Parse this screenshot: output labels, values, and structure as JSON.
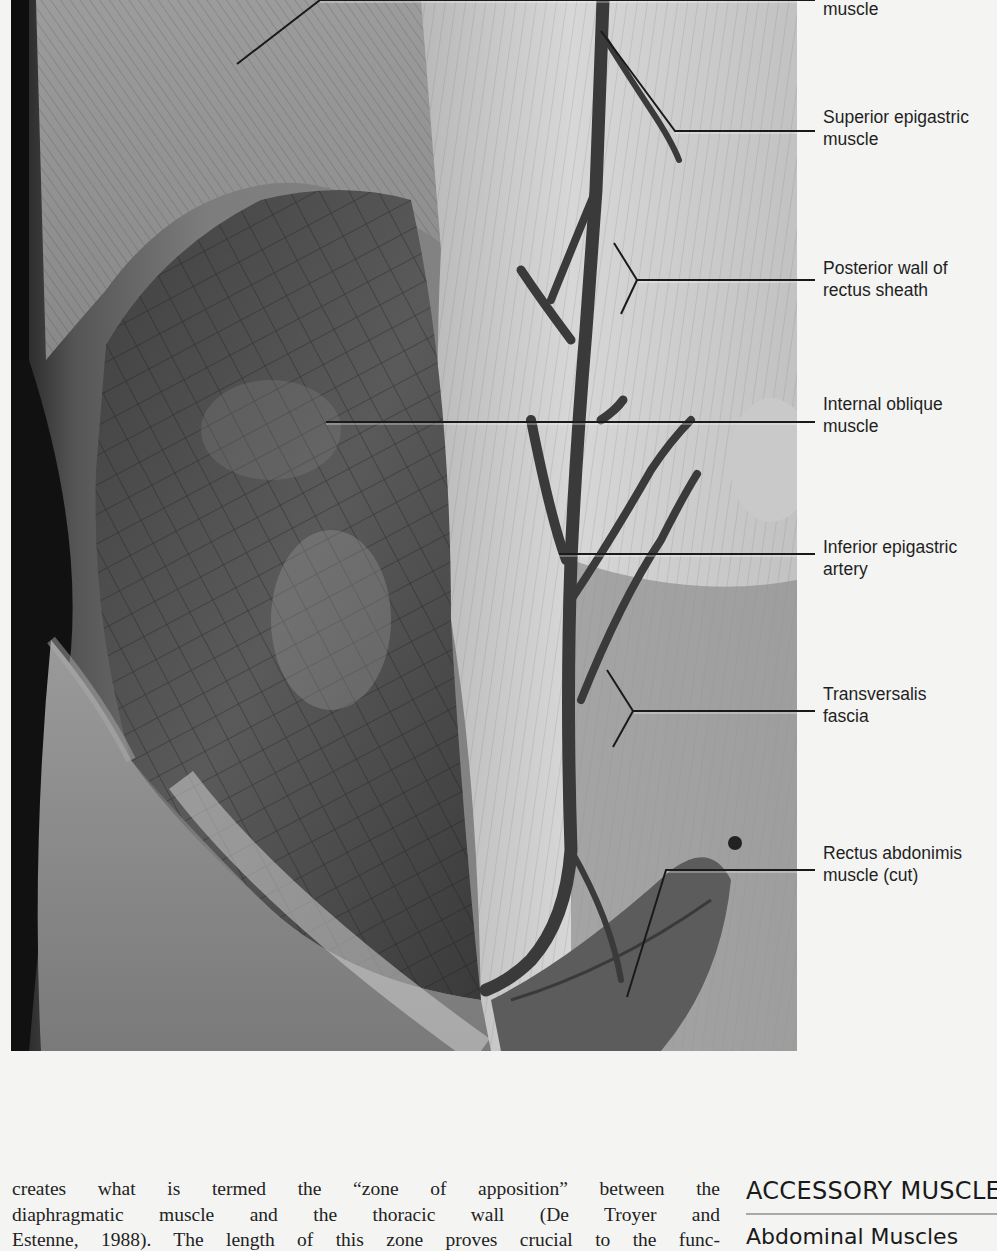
{
  "figure": {
    "colors": {
      "background": "#f4f4f2",
      "photo_dark": "#2a2a2a",
      "photo_mid": "#7a7a7a",
      "photo_light": "#d8d8d8",
      "leader_line": "#1a1a1a"
    },
    "labels": [
      {
        "id": "external-oblique",
        "lines": [
          "muscle"
        ]
      },
      {
        "id": "superior-epigastric",
        "lines": [
          "Superior epigastric",
          "muscle"
        ]
      },
      {
        "id": "posterior-wall",
        "lines": [
          "Posterior wall of",
          "rectus sheath"
        ]
      },
      {
        "id": "internal-oblique",
        "lines": [
          "Internal oblique",
          "muscle"
        ]
      },
      {
        "id": "inferior-epigastric",
        "lines": [
          "Inferior epigastric",
          "artery"
        ]
      },
      {
        "id": "transversalis",
        "lines": [
          "Transversalis",
          "fascia"
        ]
      },
      {
        "id": "rectus-abdominis",
        "lines": [
          "Rectus abdonimis",
          "muscle (cut)"
        ]
      }
    ]
  },
  "body": {
    "lines": [
      "creates what is termed the “zone of apposition” between the",
      "diaphragmatic muscle and the thoracic wall (De Troyer and",
      "Estenne, 1988). The length of this zone proves crucial to the func-"
    ]
  },
  "sidebar": {
    "section_heading": "ACCESSORY MUSCLES",
    "subheading": "Abdominal Muscles"
  }
}
